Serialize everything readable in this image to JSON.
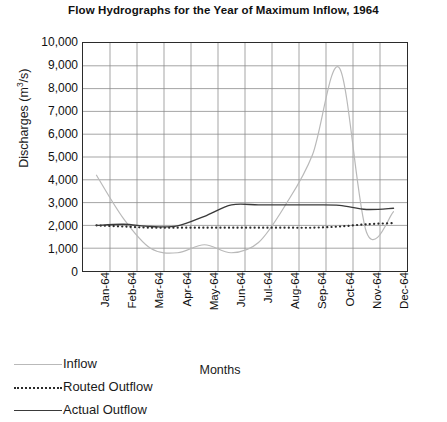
{
  "chart_data": {
    "type": "line",
    "title": "Flow Hydrographs for the Year of Maximum Inflow, 1964",
    "xlabel": "Months",
    "ylabel_text": "Discharges (m",
    "ylabel_sup": "3",
    "ylabel_tail": "/s)",
    "ylabel_full": "Discharges (m3/s)",
    "categories": [
      "Jan-64",
      "Feb-64",
      "Mar-64",
      "Apr-64",
      "May-64",
      "Jun-64",
      "Jul-64",
      "Aug-64",
      "Sep-64",
      "Oct-64",
      "Nov-64",
      "Dec-64"
    ],
    "ylim": [
      0,
      10000
    ],
    "ytick_labels": [
      "10,000",
      "9,000",
      "8,000",
      "7,000",
      "6,000",
      "5,000",
      "4,000",
      "3,000",
      "2,000",
      "1,000",
      "0"
    ],
    "ytick_values": [
      10000,
      9000,
      8000,
      7000,
      6000,
      5000,
      4000,
      3000,
      2000,
      1000,
      0
    ],
    "grid": true,
    "legend_position": "below-left",
    "series": [
      {
        "name": "Inflow",
        "style": "solid",
        "color": "#b9b9b9",
        "values": [
          4200,
          2300,
          1000,
          800,
          1150,
          800,
          1250,
          2900,
          5100,
          8900,
          1700,
          2600
        ]
      },
      {
        "name": "Routed Outflow",
        "style": "dotted",
        "color": "#2a2a2a",
        "values": [
          2000,
          1950,
          1900,
          1900,
          1900,
          1900,
          1900,
          1900,
          1900,
          1950,
          2050,
          2100
        ]
      },
      {
        "name": "Actual Outflow",
        "style": "solid",
        "color": "#3a3a3a",
        "values": [
          2000,
          2050,
          1950,
          1980,
          2400,
          2900,
          2900,
          2900,
          2900,
          2880,
          2700,
          2750
        ]
      }
    ]
  },
  "legend": {
    "items": [
      {
        "label": "Inflow",
        "key": "inflow-line-key"
      },
      {
        "label": "Routed Outflow",
        "key": "routed-outflow-line-key"
      },
      {
        "label": "Actual Outflow",
        "key": "actual-outflow-line-key"
      }
    ]
  }
}
